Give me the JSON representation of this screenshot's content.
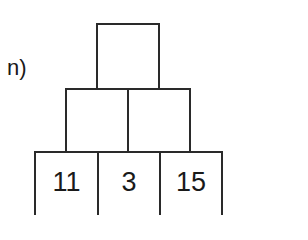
{
  "problem": {
    "label": "n)",
    "pyramid": {
      "rows": [
        {
          "row": "top",
          "cells": [
            ""
          ]
        },
        {
          "row": "middle",
          "cells": [
            "",
            ""
          ]
        },
        {
          "row": "bottom",
          "cells": [
            "11",
            "3",
            "15"
          ]
        }
      ]
    },
    "colors": {
      "border": "#2a2a2a",
      "text": "#1a1a1a",
      "background": "#ffffff"
    }
  }
}
